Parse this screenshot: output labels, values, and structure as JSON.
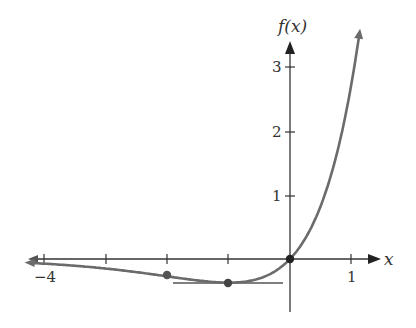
{
  "chart_data": {
    "type": "line",
    "title": "",
    "function": "f(x) = x·e^x",
    "xlabel": "x",
    "ylabel": "f(x)",
    "xlim": [
      -4.2,
      1.3
    ],
    "ylim": [
      -0.85,
      3.5
    ],
    "x_ticks": [
      -4,
      -3,
      -2,
      -1,
      0,
      1
    ],
    "x_tick_labels": [
      {
        "value": -4,
        "label": "−4"
      },
      {
        "value": 1,
        "label": "1"
      }
    ],
    "y_ticks": [
      1,
      2,
      3
    ],
    "y_tick_labels": [
      {
        "value": 1,
        "label": "1"
      },
      {
        "value": 2,
        "label": "2"
      },
      {
        "value": 3,
        "label": "3"
      }
    ],
    "grid": false,
    "legend": null,
    "series": [
      {
        "name": "f(x)",
        "color": "#6b6b6b",
        "x": [
          -4.2,
          -4,
          -3.5,
          -3,
          -2.5,
          -2,
          -1.5,
          -1,
          -0.5,
          0,
          0.25,
          0.5,
          0.75,
          1,
          1.15
        ],
        "values": [
          -0.063,
          -0.073,
          -0.106,
          -0.149,
          -0.205,
          -0.271,
          -0.335,
          -0.368,
          -0.303,
          0,
          0.321,
          0.824,
          1.588,
          2.718,
          3.63
        ]
      }
    ],
    "marked_points": [
      {
        "x": -2,
        "y": -0.271,
        "meaning": "inflection point"
      },
      {
        "x": -1,
        "y": -0.368,
        "meaning": "minimum"
      },
      {
        "x": 0,
        "y": 0,
        "meaning": "origin"
      }
    ],
    "annotations": [
      {
        "type": "horizontal tangent line",
        "y": -0.368,
        "x_from": -1.9,
        "x_to": -0.1
      }
    ]
  },
  "labels": {
    "x_axis": "x",
    "y_axis": "f(x)",
    "tick_neg4": "−4",
    "tick_1x": "1",
    "tick_1y": "1",
    "tick_2y": "2",
    "tick_3y": "3"
  }
}
